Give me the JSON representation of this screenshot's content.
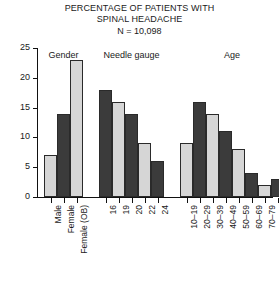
{
  "chart_data": {
    "type": "bar",
    "title": "PERCENTAGE OF PATIENTS WITH SPINAL HEADACHE",
    "title_line1": "PERCENTAGE OF PATIENTS WITH",
    "title_line2": "SPINAL HEADACHE",
    "subtitle": "N = 10,098",
    "xlabel": "",
    "ylabel": "",
    "ylim": [
      0,
      25
    ],
    "ytick_labels": [
      "0",
      "5",
      "10",
      "15",
      "20",
      "25"
    ],
    "ytick_values": [
      0,
      5,
      10,
      15,
      20,
      25
    ],
    "grid": false,
    "legend": "none",
    "groups": [
      {
        "name": "Gender",
        "categories": [
          "Male",
          "Female",
          "Female (OB)"
        ],
        "values": [
          7,
          14,
          23
        ],
        "shades": [
          "light",
          "dark",
          "light"
        ]
      },
      {
        "name": "Needle gauge",
        "categories": [
          "16",
          "19",
          "20",
          "22",
          "24"
        ],
        "values": [
          18,
          16,
          14,
          9,
          6
        ],
        "shades": [
          "dark",
          "light",
          "dark",
          "light",
          "dark"
        ]
      },
      {
        "name": "Age",
        "categories": [
          "10–19",
          "20–29",
          "30–39",
          "40–49",
          "50–59",
          "60–69",
          "70–79",
          "80–89"
        ],
        "values": [
          9,
          16,
          14,
          11,
          8,
          4,
          2,
          3
        ],
        "shades": [
          "light",
          "dark",
          "light",
          "dark",
          "light",
          "dark",
          "light",
          "dark"
        ]
      }
    ],
    "categories": [
      "Male",
      "Female",
      "Female (OB)",
      "16",
      "19",
      "20",
      "22",
      "24",
      "10–19",
      "20–29",
      "30–39",
      "40–49",
      "50–59",
      "60–69",
      "70–79",
      "80–89"
    ],
    "values": [
      7,
      14,
      23,
      18,
      16,
      14,
      9,
      6,
      9,
      16,
      14,
      11,
      8,
      4,
      2,
      3
    ],
    "colors": {
      "light_bar": "#d6d6d6",
      "dark_bar": "#3b3b3b",
      "axis": "#111111",
      "text": "#1a1a1a"
    }
  }
}
